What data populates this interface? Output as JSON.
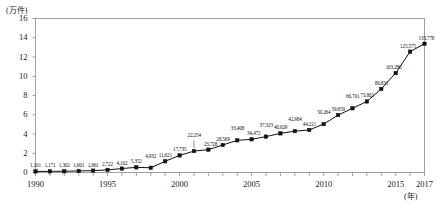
{
  "chart_data": {
    "type": "line",
    "title": "",
    "subtitle": "",
    "xlabel": "(年)",
    "ylabel": "(万件)",
    "x": [
      1990,
      1991,
      1992,
      1993,
      1994,
      1995,
      1996,
      1997,
      1998,
      1999,
      2000,
      2001,
      2002,
      2003,
      2004,
      2005,
      2006,
      2007,
      2008,
      2009,
      2010,
      2011,
      2012,
      2013,
      2014,
      2015,
      2016,
      2017
    ],
    "values": [
      1101,
      1171,
      1302,
      1601,
      1961,
      2722,
      4102,
      5352,
      4932,
      11621,
      17735,
      22254,
      23728,
      28569,
      33408,
      34472,
      37323,
      40629,
      42984,
      44211,
      50264,
      59659,
      66701,
      73802,
      86831,
      103286,
      125575,
      133778
    ],
    "point_labels": [
      "1,101",
      "1,171",
      "1,302",
      "1,601",
      "1,961",
      "2,722",
      "4,102",
      "5,352",
      "4,932",
      "11,621",
      "17,735",
      "22,254",
      "23,728",
      "28,569",
      "33,408",
      "34,472",
      "37,323",
      "40,629",
      "42,984",
      "44,211",
      "50,264",
      "59,659",
      "66,701",
      "73,802",
      "86,831",
      "103,286",
      "125,575",
      "133,778"
    ],
    "ylim": [
      0,
      160000
    ],
    "y_ticks": [
      0,
      20000,
      40000,
      60000,
      80000,
      100000,
      120000,
      140000,
      160000
    ],
    "y_tick_labels": [
      "0",
      "2",
      "4",
      "6",
      "8",
      "10",
      "12",
      "14",
      "16"
    ],
    "x_tick_years": [
      1990,
      1995,
      2000,
      2005,
      2010,
      2015,
      2017
    ],
    "x_tick_labels": [
      "1990",
      "1995",
      "2000",
      "2005",
      "2010",
      "2015",
      "2017"
    ],
    "xlim": [
      1990,
      2017
    ],
    "grid": false,
    "legend": false,
    "marker": "square",
    "series_color": "#111111",
    "axis_color": "#8a8a8a",
    "background": "#ffffff"
  }
}
